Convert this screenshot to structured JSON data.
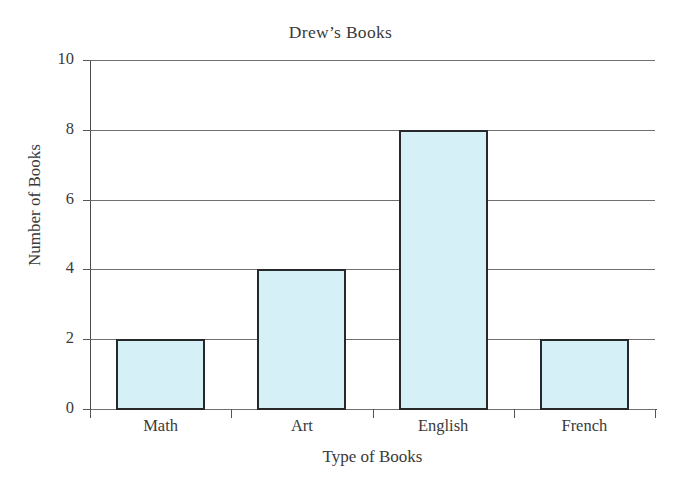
{
  "chart_data": {
    "type": "bar",
    "title": "Drew’s Books",
    "xlabel": "Type of Books",
    "ylabel": "Number of Books",
    "categories": [
      "Math",
      "Art",
      "English",
      "French"
    ],
    "values": [
      2,
      4,
      8,
      2
    ],
    "ylim": [
      0,
      10
    ],
    "ytick_labels": [
      "0",
      "2",
      "4",
      "6",
      "8",
      "10"
    ],
    "ytick_values": [
      0,
      2,
      4,
      6,
      8,
      10
    ],
    "grid": "horizontal",
    "legend": "none",
    "bar_fill_color": "#d6f0f7",
    "bar_edge_color": "#27282a",
    "background_color": "#ffffff",
    "gridline_color": "#6f6f6f",
    "axis_color": "#4a4a4a"
  }
}
